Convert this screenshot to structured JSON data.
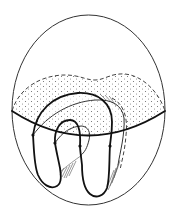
{
  "figure": {
    "colors": {
      "background": "#ffffff",
      "line": "#111111",
      "stipple": "#666666"
    },
    "elements": {
      "outer_boundary": "ovoid",
      "disk": "stippled horizontal disk with dashed back rim and solid front rim",
      "ribbon": "folded band with two lower loops and nested upper arches",
      "crossing_points": 4
    }
  }
}
